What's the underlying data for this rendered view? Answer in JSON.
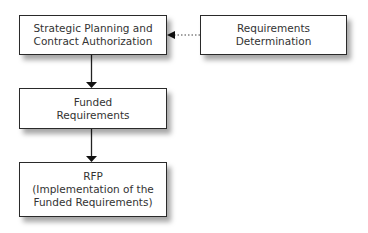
{
  "diagram": {
    "type": "flowchart",
    "nodes": [
      {
        "id": "strategic",
        "label": "Strategic Planning and\nContract Authorization"
      },
      {
        "id": "requirements",
        "label": "Requirements\nDetermination"
      },
      {
        "id": "funded",
        "label": "Funded\nRequirements"
      },
      {
        "id": "rfp",
        "label": "RFP\n(Implementation of the\nFunded Requirements)"
      }
    ],
    "edges": [
      {
        "from": "requirements",
        "to": "strategic",
        "style": "dotted"
      },
      {
        "from": "strategic",
        "to": "funded",
        "style": "solid"
      },
      {
        "from": "funded",
        "to": "rfp",
        "style": "solid"
      }
    ]
  }
}
